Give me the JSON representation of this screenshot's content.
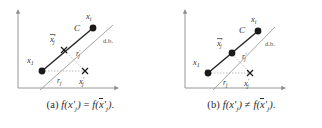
{
  "figure": {
    "subfigures": [
      {
        "id": "a",
        "caption_tag": "(a)",
        "caption_text": "(a) f(x′j) = f(x̄′j).",
        "caption_relation": "=",
        "labels": {
          "x_i": "x",
          "x_i_sub": "i",
          "C": "C",
          "db": "d.b.",
          "xbar_prime_j": "x",
          "xbar_prime_j_sub": "j",
          "x_1": "x",
          "x_1_sub": "1",
          "r_prime_j": "r",
          "r_prime_j_sub": "j",
          "r_j": "r",
          "r_j_sub": "j",
          "x_prime_j": "x",
          "x_prime_j_sub": "j"
        }
      },
      {
        "id": "b",
        "caption_tag": "(b)",
        "caption_text": "(b) f(x′j) ≠ f(x̄′j).",
        "caption_relation": "≠",
        "labels": {
          "x_i": "x",
          "x_i_sub": "i",
          "C": "C",
          "db": "d.b.",
          "xbar_prime_j": "x",
          "xbar_prime_j_sub": "j",
          "x_1": "x",
          "x_1_sub": "1",
          "r_prime_j": "r",
          "r_prime_j_sub": "j",
          "r_j": "r",
          "r_j_sub": "j",
          "x_prime_j": "x",
          "x_prime_j_sub": "j"
        }
      }
    ],
    "caption_math": {
      "f": "f",
      "lparen": "(",
      "rparen": ")",
      "prime": "′",
      "period": ".",
      "x": "x",
      "sub_j": "j",
      "eq": "=",
      "neq": "≠"
    },
    "colors": {
      "axis": "#8e8b88",
      "decision_boundary": "#a8a5a2",
      "segment": "#2b2927",
      "marker_fill": "#1a1a1a",
      "dotted": "#b5b2af",
      "text": "#33302f",
      "background": "#ffffff"
    },
    "glyphs": {
      "dot_marker": "filled-circle",
      "cross_marker": "x-cross",
      "arrow": "arrowhead"
    }
  }
}
